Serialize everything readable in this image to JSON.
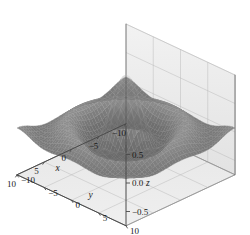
{
  "chart_data": {
    "type": "surface",
    "title": "",
    "xlabel": "x",
    "ylabel": "y",
    "zlabel": "z",
    "xlim": [
      -10,
      10
    ],
    "ylim": [
      -10,
      10
    ],
    "zlim": [
      -0.75,
      1.0
    ],
    "xticks": [
      "-10",
      "-5",
      "0",
      "5",
      "10"
    ],
    "yticks": [
      "-10",
      "-5",
      "0",
      "5",
      "10"
    ],
    "zticks": [
      "0.5",
      "0.0",
      "-0.5"
    ],
    "ztick_values": [
      0.5,
      0.0,
      -0.5
    ],
    "grid": true,
    "legend": null,
    "colormap": "grayscale",
    "mesh": true,
    "projection": "3d",
    "function": "z = sin(r)/r",
    "surface_min": -0.55,
    "surface_max": 1.0,
    "samples": 41
  },
  "axes": {
    "x": {
      "label": "x",
      "ticks": [
        {
          "value": -10,
          "label": "-10"
        },
        {
          "value": -5,
          "label": "-5"
        },
        {
          "value": 0,
          "label": "0"
        },
        {
          "value": 5,
          "label": "5"
        },
        {
          "value": 10,
          "label": "10"
        }
      ]
    },
    "y": {
      "label": "y",
      "ticks": [
        {
          "value": -10,
          "label": "-10"
        },
        {
          "value": -5,
          "label": "-5"
        },
        {
          "value": 0,
          "label": "0"
        },
        {
          "value": 5,
          "label": "5"
        },
        {
          "value": 10,
          "label": "10"
        }
      ]
    },
    "z": {
      "label": "z",
      "ticks": [
        {
          "value": 0.5,
          "label": "0.5"
        },
        {
          "value": 0.0,
          "label": "0.0"
        },
        {
          "value": -0.5,
          "label": "-0.5"
        }
      ]
    }
  },
  "colors": {
    "background": "#ffffff",
    "panel": "#e9e9e9",
    "panel_light": "#f0f0f0",
    "floor": "#e4e4e4",
    "grid": "#b5b5b5",
    "axis": "#4a4a4a",
    "surface_light": "#d8d8d8",
    "surface_mid": "#8a8a8a",
    "surface_dark": "#242424",
    "text": "#1a1a1a"
  }
}
